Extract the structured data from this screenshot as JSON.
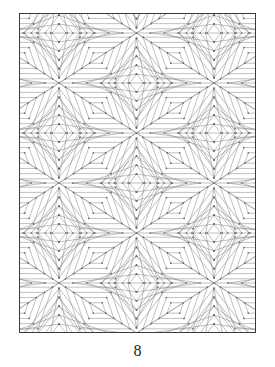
{
  "page": {
    "background_color": "#ffffff",
    "number": "8",
    "number_color": "#202020"
  },
  "artwork": {
    "title": "geometric-diamond-tessellation",
    "kind": "line-art-coloring-page",
    "frame": {
      "x": 19,
      "y": 13,
      "width": 237,
      "height": 320,
      "border_color": "#3a3a3a",
      "border_width": 1,
      "fill_color": "#ffffff"
    },
    "line_color": "#8c8c8c",
    "line_width": 0.55,
    "vertex_dot_color": "#6a6a6a",
    "vertex_dot_radius": 0.85,
    "lattice": {
      "description": "staggered grid of six-way star convergence points",
      "period_x": 155,
      "period_y": 100,
      "row_offset_x": 77.5,
      "row_offset_y": 50,
      "origin_x": 59,
      "origin_y": 83,
      "rings_per_cell": 5,
      "ring_step": 9.5,
      "diamond_half_width": 47,
      "diamond_half_height": 50
    }
  }
}
